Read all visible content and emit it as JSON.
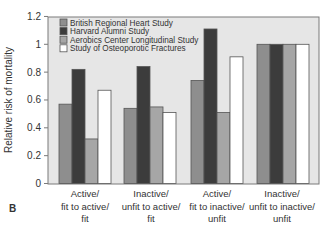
{
  "chart_data": {
    "type": "bar",
    "title": "",
    "panel_label": "B",
    "xlabel": "",
    "ylabel": "Relative risk of mortality",
    "ylim": [
      0,
      1.2
    ],
    "yticks": [
      0,
      0.2,
      0.4,
      0.6,
      0.8,
      1,
      1.2
    ],
    "ytick_labels": [
      "0",
      "0.2",
      "0.4",
      "0.6",
      "0.8",
      "1",
      "1.2"
    ],
    "grid": false,
    "legend_position": "upper-left-inside",
    "categories": [
      [
        "Active/",
        "fit to active/",
        "fit"
      ],
      [
        "Inactive/",
        "unfit to active/",
        "fit"
      ],
      [
        "Active/",
        "fit to inactive/",
        "unfit"
      ],
      [
        "Inactive/",
        "unfit to inactive/",
        "unfit"
      ]
    ],
    "series": [
      {
        "name": "British Regional Heart Study",
        "color": "#8e8e8e",
        "values": [
          0.57,
          0.54,
          0.74,
          1.0
        ]
      },
      {
        "name": "Harvard Alumni Study",
        "color": "#3c3c3c",
        "values": [
          0.82,
          0.84,
          1.11,
          1.0
        ]
      },
      {
        "name": "Aerobics Center Longitudinal Study",
        "color": "#a6a6a6",
        "values": [
          0.32,
          0.55,
          0.51,
          1.0
        ]
      },
      {
        "name": "Study of Osteoporotic Fractures",
        "color": "#ffffff",
        "values": [
          0.67,
          0.51,
          0.91,
          1.0
        ]
      }
    ]
  },
  "colors": {
    "plot_background": "#e6e6e6",
    "frame": "#7a7a7a",
    "text": "#333333"
  }
}
